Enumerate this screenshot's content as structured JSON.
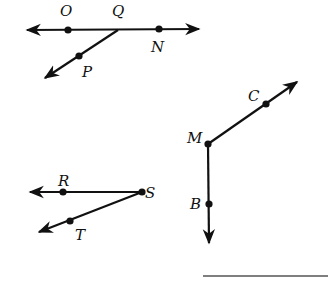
{
  "diagram": {
    "figures": [
      {
        "id": "figure-1",
        "description": "Line through O and N with ray QP from point Q",
        "points": [
          {
            "name": "O",
            "x": 68,
            "y": 30,
            "lx": 60,
            "ly": 16
          },
          {
            "name": "Q",
            "x": 118,
            "y": 30,
            "lx": 112,
            "ly": 16
          },
          {
            "name": "N",
            "x": 159,
            "y": 29,
            "lx": 151,
            "ly": 52
          },
          {
            "name": "P",
            "x": 79,
            "y": 56,
            "lx": 82,
            "ly": 77
          }
        ]
      },
      {
        "id": "figure-2",
        "description": "Rays MC and MB sharing endpoint M",
        "points": [
          {
            "name": "M",
            "x": 208,
            "y": 144,
            "lx": 187,
            "ly": 143
          },
          {
            "name": "C",
            "x": 266,
            "y": 104,
            "lx": 248,
            "ly": 101
          },
          {
            "name": "B",
            "x": 209,
            "y": 204,
            "lx": 190,
            "ly": 209
          }
        ]
      },
      {
        "id": "figure-3",
        "description": "Rays SR and ST sharing endpoint S",
        "points": [
          {
            "name": "R",
            "x": 63,
            "y": 192,
            "lx": 58,
            "ly": 186
          },
          {
            "name": "S",
            "x": 142,
            "y": 192,
            "lx": 145,
            "ly": 198
          },
          {
            "name": "T",
            "x": 70,
            "y": 221,
            "lx": 75,
            "ly": 240
          }
        ]
      }
    ],
    "labels": {
      "O": "O",
      "Q": "Q",
      "N": "N",
      "P": "P",
      "M": "M",
      "C": "C",
      "B": "B",
      "R": "R",
      "S": "S",
      "T": "T"
    },
    "answer_blank": {
      "x1": 203,
      "x2": 328,
      "y": 276
    }
  }
}
